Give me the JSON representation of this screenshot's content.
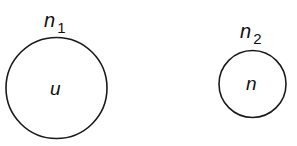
{
  "diagram": {
    "nodes": [
      {
        "label": "n",
        "subscript": "1",
        "inner": "u",
        "cx": 56.5,
        "cy": 88,
        "r": 50.5
      },
      {
        "label": "n",
        "subscript": "2",
        "inner": "n",
        "cx": 252.5,
        "cy": 84,
        "r": 33.5
      }
    ],
    "stroke_color": "#1a1a1a"
  }
}
